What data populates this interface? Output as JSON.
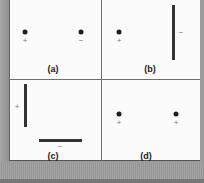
{
  "figure": {
    "panels": [
      {
        "id": "a",
        "label": "(a)",
        "description": "two point charges: positive and negative"
      },
      {
        "id": "b",
        "label": "(b)",
        "description": "positive point charge and negatively charged rod"
      },
      {
        "id": "c",
        "label": "(c)",
        "description": "positively charged vertical rod and negatively charged horizontal rod"
      },
      {
        "id": "d",
        "label": "(d)",
        "description": "two positive point charges"
      }
    ],
    "signs": {
      "positive": "+",
      "negative": "−"
    },
    "colors": {
      "charge": "#1e1e1e",
      "rod": "#333333",
      "sign": "#7a7a7a",
      "background": "#fbfbfb",
      "frame": "#9a9a9a"
    }
  }
}
